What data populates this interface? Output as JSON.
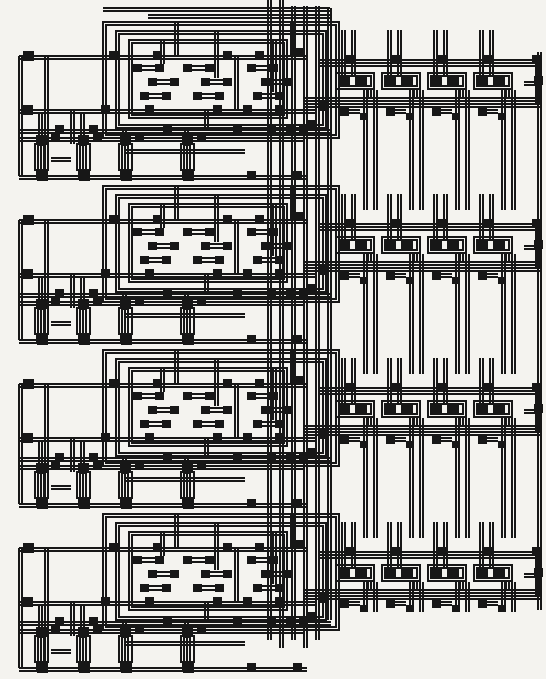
{
  "figure": {
    "kind": "ic-mask-layout-scan",
    "width": 546,
    "height": 679,
    "palette": {
      "paper": "#f4f3ef",
      "ink": "#171717"
    },
    "stroke": 1.1,
    "double_gap": 3
  },
  "left_blocks": {
    "origin_x": 15,
    "ys": [
      18,
      182,
      346,
      510
    ],
    "prims": [
      [
        "r",
        88,
        4,
        236,
        116
      ],
      [
        "r",
        101,
        13,
        210,
        97
      ],
      [
        "r",
        114,
        22,
        158,
        78
      ],
      [
        "d",
        4,
        38,
        292,
        38
      ],
      [
        "d",
        4,
        92,
        300,
        92
      ],
      [
        "d",
        4,
        112,
        316,
        112
      ],
      [
        "d",
        4,
        120,
        290,
        120
      ],
      [
        "d",
        4,
        158,
        292,
        158
      ],
      [
        "d",
        4,
        38,
        4,
        158
      ],
      [
        "d",
        30,
        38,
        30,
        152
      ],
      [
        "d",
        56,
        92,
        56,
        126
      ],
      [
        "d",
        24,
        96,
        24,
        128
      ],
      [
        "d",
        66,
        96,
        66,
        128
      ],
      [
        "d",
        108,
        112,
        108,
        128
      ],
      [
        "d",
        170,
        112,
        170,
        128
      ],
      [
        "d",
        146,
        22,
        146,
        46
      ],
      [
        "d",
        160,
        4,
        160,
        38
      ],
      [
        "d",
        200,
        13,
        200,
        60
      ],
      [
        "d",
        220,
        38,
        220,
        92
      ],
      [
        "d",
        258,
        22,
        258,
        74
      ],
      [
        "d",
        276,
        4,
        276,
        38
      ],
      [
        "d",
        190,
        92,
        190,
        112
      ],
      [
        "d",
        110,
        132,
        230,
        132
      ],
      [
        "d",
        36,
        140,
        56,
        140
      ],
      [
        "s",
        8,
        33,
        11,
        10
      ],
      [
        "s",
        94,
        33,
        9,
        9
      ],
      [
        "s",
        138,
        33,
        9,
        9
      ],
      [
        "s",
        208,
        33,
        9,
        9
      ],
      [
        "s",
        240,
        33,
        9,
        9
      ],
      [
        "s",
        8,
        87,
        10,
        10
      ],
      [
        "s",
        86,
        87,
        9,
        9
      ],
      [
        "s",
        130,
        87,
        9,
        9
      ],
      [
        "s",
        198,
        87,
        9,
        9
      ],
      [
        "s",
        228,
        87,
        9,
        9
      ],
      [
        "s",
        260,
        87,
        9,
        9
      ],
      [
        "s",
        40,
        107,
        9,
        9
      ],
      [
        "s",
        74,
        107,
        9,
        9
      ],
      [
        "s",
        148,
        107,
        9,
        9
      ],
      [
        "s",
        218,
        107,
        9,
        9
      ],
      [
        "s",
        252,
        107,
        9,
        9
      ],
      [
        "s",
        284,
        107,
        9,
        9
      ],
      [
        "p",
        118,
        46
      ],
      [
        "p",
        168,
        46
      ],
      [
        "p",
        232,
        46
      ],
      [
        "p",
        133,
        60
      ],
      [
        "p",
        186,
        60
      ],
      [
        "p",
        246,
        60
      ],
      [
        "p",
        125,
        74
      ],
      [
        "p",
        178,
        74
      ],
      [
        "p",
        238,
        74
      ],
      [
        "s",
        36,
        116,
        9,
        8
      ],
      [
        "s",
        78,
        116,
        9,
        8
      ],
      [
        "s",
        120,
        116,
        9,
        8
      ],
      [
        "s",
        182,
        116,
        9,
        8
      ],
      [
        "t",
        20,
        126
      ],
      [
        "t",
        62,
        126
      ],
      [
        "t",
        104,
        126
      ],
      [
        "t",
        166,
        126
      ],
      [
        "s",
        22,
        152,
        11,
        11
      ],
      [
        "s",
        64,
        152,
        11,
        11
      ],
      [
        "s",
        106,
        152,
        11,
        11
      ],
      [
        "s",
        168,
        152,
        11,
        11
      ],
      [
        "s",
        232,
        153,
        9,
        9
      ],
      [
        "s",
        278,
        153,
        9,
        9
      ]
    ],
    "channel_squares_rel": [
      [
        281,
        30
      ],
      [
        293,
        102
      ],
      [
        305,
        84
      ],
      [
        271,
        108
      ]
    ]
  },
  "right_rows": {
    "origin_x": 318,
    "rows": [
      {
        "y": 46,
        "short": false
      },
      {
        "y": 210,
        "short": false
      },
      {
        "y": 374,
        "short": false
      },
      {
        "y": 538,
        "short": true
      }
    ],
    "cell_xs": [
      20,
      66,
      112,
      158
    ],
    "row_prims": [
      [
        "d",
        2,
        14,
        224,
        14
      ],
      [
        "l",
        2,
        20,
        224,
        20
      ],
      [
        "d",
        -14,
        52,
        224,
        52
      ],
      [
        "d",
        -14,
        58,
        224,
        58
      ],
      [
        "c",
        20
      ],
      [
        "c",
        66
      ],
      [
        "c",
        112
      ],
      [
        "c",
        158
      ],
      [
        "s",
        214,
        9,
        9,
        9
      ],
      [
        "d",
        218,
        14,
        218,
        58
      ],
      [
        "s",
        216,
        30,
        9,
        9
      ],
      [
        "d",
        206,
        36,
        220,
        36
      ]
    ],
    "cell_prims": [
      [
        "s",
        8,
        9,
        10,
        9
      ],
      [
        "d",
        4,
        -16,
        4,
        29
      ],
      [
        "d",
        14,
        -16,
        14,
        29
      ],
      [
        "s",
        0,
        29,
        12,
        12
      ],
      [
        "s",
        17,
        29,
        12,
        12
      ],
      [
        "r",
        -2,
        27,
        38,
        16
      ],
      [
        "d",
        30,
        43,
        30,
        52
      ],
      [
        "s",
        2,
        62,
        9,
        8
      ],
      [
        "d",
        11,
        64,
        22,
        64
      ],
      [
        "s",
        22,
        67,
        8,
        7
      ],
      [
        "d",
        26,
        44,
        26,
        164
      ],
      [
        "d",
        36,
        44,
        36,
        164
      ]
    ]
  },
  "channel": {
    "prims": [
      [
        "d",
        268,
        0,
        268,
        640
      ],
      [
        "d",
        280,
        0,
        280,
        648
      ],
      [
        "d",
        292,
        6,
        292,
        640
      ],
      [
        "d",
        304,
        6,
        304,
        648
      ],
      [
        "d",
        316,
        6,
        316,
        640
      ],
      [
        "d",
        328,
        8,
        328,
        620
      ],
      [
        "d",
        103,
        8,
        330,
        8
      ],
      [
        "d",
        148,
        15,
        330,
        15
      ],
      [
        "d",
        538,
        52,
        538,
        610
      ]
    ]
  }
}
